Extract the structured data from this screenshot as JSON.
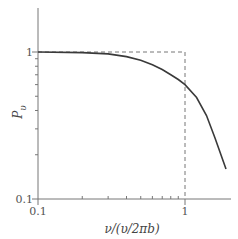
{
  "chart_data": {
    "type": "line",
    "title": "",
    "xlabel": "ν/(υ/2πb)",
    "ylabel": "P_υ",
    "xscale": "log",
    "yscale": "log",
    "xlim": [
      0.1,
      2.0
    ],
    "ylim": [
      0.1,
      2.0
    ],
    "x_tick_labels": [
      "0.1",
      "1"
    ],
    "y_tick_labels": [
      "0.1",
      "1"
    ],
    "grid": false,
    "legend": null,
    "series": [
      {
        "name": "P_υ",
        "style": "solid",
        "color": "#3a3a3a",
        "x": [
          0.1,
          0.2,
          0.3,
          0.4,
          0.5,
          0.6,
          0.7,
          0.8,
          0.9,
          1.0,
          1.2,
          1.4,
          1.6,
          1.9
        ],
        "y": [
          1.0,
          0.99,
          0.97,
          0.93,
          0.88,
          0.82,
          0.76,
          0.7,
          0.65,
          0.6,
          0.49,
          0.37,
          0.26,
          0.16
        ]
      },
      {
        "name": "ideal (step)",
        "style": "dashed",
        "color": "#666666",
        "x": [
          0.1,
          1.0,
          1.0
        ],
        "y": [
          1.0,
          1.0,
          0.1
        ]
      }
    ]
  },
  "labels": {
    "x_tick_0": "0.1",
    "x_tick_1": "1",
    "y_tick_0": "0.1",
    "y_tick_1": "1",
    "xlabel": "ν/(υ/2πb)",
    "ylabel_main": "P",
    "ylabel_sub": "υ"
  }
}
